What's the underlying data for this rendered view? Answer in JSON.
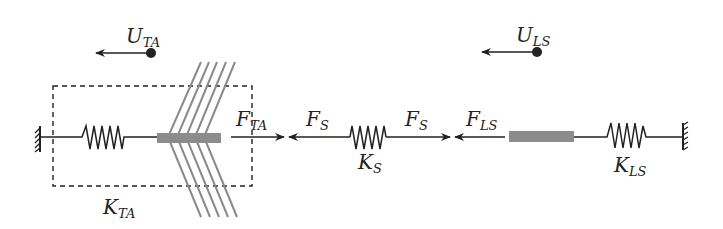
{
  "diagram": {
    "labels": {
      "u_ta": {
        "main": "U",
        "sub": "TA"
      },
      "u_ls": {
        "main": "U",
        "sub": "LS"
      },
      "f_ta": {
        "main": "F",
        "sub": "TA"
      },
      "f_s_left": {
        "main": "F",
        "sub": "S"
      },
      "f_s_right": {
        "main": "F",
        "sub": "S"
      },
      "f_ls": {
        "main": "F",
        "sub": "LS"
      },
      "k_ta": {
        "main": "K",
        "sub": "TA"
      },
      "k_s": {
        "main": "K",
        "sub": "S"
      },
      "k_ls": {
        "main": "K",
        "sub": "LS"
      }
    },
    "components": [
      "left-wall-anchor",
      "spring-K_TA",
      "muscle-bar-TA",
      "muscle-fibers",
      "dashed-box-TA",
      "spring-K_S",
      "muscle-bar-LS",
      "spring-K_LS",
      "right-wall-anchor"
    ],
    "colors": {
      "line": "#222222",
      "bar": "#8c8c8c",
      "fiber": "#8a8a8a"
    }
  }
}
